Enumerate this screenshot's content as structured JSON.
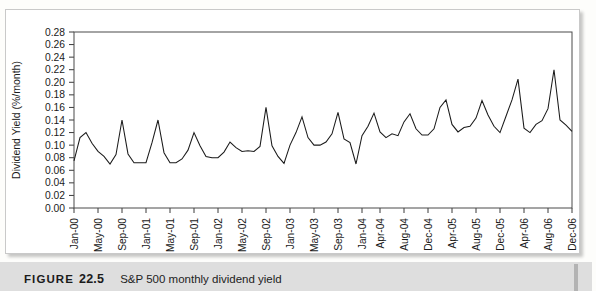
{
  "caption": {
    "figure_word": "FIGURE",
    "figure_number": "22.5",
    "title": "S&P 500 monthly dividend yield"
  },
  "chart_data": {
    "type": "line",
    "title": "S&P 500 monthly dividend yield",
    "xlabel": "",
    "ylabel": "Dividend Yield (%/month)",
    "ylim": [
      0.0,
      0.28
    ],
    "ytick_labels": [
      "0.00",
      "0.02",
      "0.04",
      "0.06",
      "0.08",
      "0.10",
      "0.12",
      "0.14",
      "0.16",
      "0.18",
      "0.20",
      "0.22",
      "0.24",
      "0.26",
      "0.28"
    ],
    "ytick_values": [
      0.0,
      0.02,
      0.04,
      0.06,
      0.08,
      0.1,
      0.12,
      0.14,
      0.16,
      0.18,
      0.2,
      0.22,
      0.24,
      0.26,
      0.28
    ],
    "grid": false,
    "legend": null,
    "xtick_labels": [
      "Jan-00",
      "May-00",
      "Sep-00",
      "Jan-01",
      "May-01",
      "Sep-01",
      "Jan-02",
      "May-02",
      "Sep-02",
      "Jan-03",
      "May-03",
      "Sep-03",
      "Jan-04",
      "Apr-04",
      "Aug-04",
      "Dec-04",
      "Apr-05",
      "Aug-05",
      "Dec-05",
      "Apr-06",
      "Aug-06",
      "Dec-06"
    ],
    "xtick_indices": [
      0,
      4,
      8,
      12,
      16,
      20,
      24,
      28,
      32,
      36,
      40,
      44,
      48,
      51,
      55,
      59,
      63,
      67,
      71,
      75,
      79,
      83
    ],
    "x": [
      "Jan-00",
      "Feb-00",
      "Mar-00",
      "Apr-00",
      "May-00",
      "Jun-00",
      "Jul-00",
      "Aug-00",
      "Sep-00",
      "Oct-00",
      "Nov-00",
      "Dec-00",
      "Jan-01",
      "Feb-01",
      "Mar-01",
      "Apr-01",
      "May-01",
      "Jun-01",
      "Jul-01",
      "Aug-01",
      "Sep-01",
      "Oct-01",
      "Nov-01",
      "Dec-01",
      "Jan-02",
      "Feb-02",
      "Mar-02",
      "Apr-02",
      "May-02",
      "Jun-02",
      "Jul-02",
      "Aug-02",
      "Sep-02",
      "Oct-02",
      "Nov-02",
      "Dec-02",
      "Jan-03",
      "Feb-03",
      "Mar-03",
      "Apr-03",
      "May-03",
      "Jun-03",
      "Jul-03",
      "Aug-03",
      "Sep-03",
      "Oct-03",
      "Nov-03",
      "Dec-03",
      "Jan-04",
      "Feb-04",
      "Mar-04",
      "Apr-04",
      "May-04",
      "Jun-04",
      "Jul-04",
      "Aug-04",
      "Sep-04",
      "Oct-04",
      "Nov-04",
      "Dec-04",
      "Jan-05",
      "Feb-05",
      "Mar-05",
      "Apr-05",
      "May-05",
      "Jun-05",
      "Jul-05",
      "Aug-05",
      "Sep-05",
      "Oct-05",
      "Nov-05",
      "Dec-05",
      "Jan-06",
      "Feb-06",
      "Mar-06",
      "Apr-06",
      "May-06",
      "Jun-06",
      "Jul-06",
      "Aug-06",
      "Sep-06",
      "Oct-06",
      "Nov-06",
      "Dec-06"
    ],
    "values": [
      0.075,
      0.112,
      0.12,
      0.103,
      0.09,
      0.082,
      0.07,
      0.085,
      0.14,
      0.086,
      0.072,
      0.072,
      0.072,
      0.104,
      0.14,
      0.088,
      0.072,
      0.072,
      0.078,
      0.092,
      0.12,
      0.099,
      0.082,
      0.08,
      0.08,
      0.089,
      0.105,
      0.096,
      0.09,
      0.091,
      0.09,
      0.098,
      0.16,
      0.099,
      0.082,
      0.071,
      0.1,
      0.12,
      0.145,
      0.112,
      0.1,
      0.1,
      0.105,
      0.118,
      0.152,
      0.11,
      0.104,
      0.07,
      0.115,
      0.13,
      0.151,
      0.121,
      0.112,
      0.118,
      0.115,
      0.137,
      0.15,
      0.126,
      0.116,
      0.116,
      0.126,
      0.16,
      0.172,
      0.133,
      0.121,
      0.128,
      0.13,
      0.143,
      0.171,
      0.148,
      0.13,
      0.12,
      0.146,
      0.172,
      0.205,
      0.127,
      0.12,
      0.133,
      0.139,
      0.158,
      0.22,
      0.14,
      0.132,
      0.122
    ],
    "series_name": "S&P 500 dividend yield"
  }
}
